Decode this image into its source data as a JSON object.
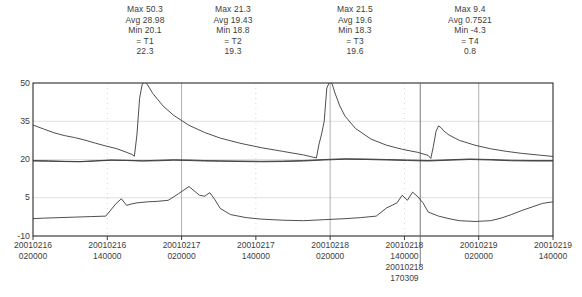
{
  "header": {
    "stats": [
      {
        "id": "T1",
        "max_label": "Max 50.3",
        "avg_label": "Avg 28.98",
        "min_label": "Min 20.1",
        "name_label": "= T1",
        "value_label": "22.3",
        "max": 50.3,
        "avg": 28.98,
        "min": 20.1,
        "cursor_value": 22.3
      },
      {
        "id": "T2",
        "max_label": "Max 21.3",
        "avg_label": "Avg 19.43",
        "min_label": "Min 18.8",
        "name_label": "= T2",
        "value_label": "19.3",
        "max": 21.3,
        "avg": 19.43,
        "min": 18.8,
        "cursor_value": 19.3
      },
      {
        "id": "T3",
        "max_label": "Max 21.5",
        "avg_label": "Avg 19.6",
        "min_label": "Min 18.3",
        "name_label": "= T3",
        "value_label": "19.6",
        "max": 21.5,
        "avg": 19.6,
        "min": 18.3,
        "cursor_value": 19.6
      },
      {
        "id": "T4",
        "max_label": "Max 9.4",
        "avg_label": "Avg 0.7521",
        "min_label": "Min -4.3",
        "name_label": "= T4",
        "value_label": "0.8",
        "max": 9.4,
        "avg": 0.7521,
        "min": -4.3,
        "cursor_value": 0.8
      }
    ]
  },
  "axes": {
    "y_ticks": [
      "50",
      "35",
      "20",
      "5",
      "-10"
    ],
    "x_ticks": [
      {
        "date": "20010216",
        "time": "020000"
      },
      {
        "date": "20010216",
        "time": "140000"
      },
      {
        "date": "20010217",
        "time": "020000"
      },
      {
        "date": "20010217",
        "time": "140000"
      },
      {
        "date": "20010218",
        "time": "020000"
      },
      {
        "date": "20010218",
        "time": "140000"
      },
      {
        "date": "20010219",
        "time": "020000"
      },
      {
        "date": "20010219",
        "time": "140000"
      }
    ]
  },
  "cursor": {
    "date": "20010218",
    "time": "170309"
  },
  "chart_data": {
    "type": "line",
    "title": "",
    "xlabel": "",
    "ylabel": "",
    "ylim": [
      -10,
      50
    ],
    "ytick_values": [
      50,
      35,
      20,
      5,
      -10
    ],
    "grid": {
      "horizontal": true,
      "vertical": true,
      "vertical_style": "dotted"
    },
    "legend": "none",
    "x_axis_type": "datetime",
    "x_start": "20010216 020000",
    "x_end": "20010219 140000",
    "x_tick_labels": [
      "20010216 020000",
      "20010216 140000",
      "20010217 020000",
      "20010217 140000",
      "20010218 020000",
      "20010218 140000",
      "20010219 020000",
      "20010219 140000"
    ],
    "cursor_x": "20010218 170309",
    "series": [
      {
        "name": "T1",
        "color": "#3a3a3a",
        "max": 50.3,
        "avg": 28.98,
        "min": 20.1,
        "value_at_cursor": 22.3,
        "x": [
          0,
          0.02,
          0.04,
          0.06,
          0.08,
          0.1,
          0.12,
          0.14,
          0.16,
          0.175,
          0.19,
          0.195,
          0.2,
          0.205,
          0.21,
          0.215,
          0.22,
          0.23,
          0.25,
          0.27,
          0.3,
          0.33,
          0.36,
          0.4,
          0.44,
          0.48,
          0.52,
          0.545,
          0.55,
          0.555,
          0.56,
          0.565,
          0.57,
          0.575,
          0.58,
          0.59,
          0.6,
          0.62,
          0.65,
          0.68,
          0.71,
          0.74,
          0.76,
          0.765,
          0.77,
          0.775,
          0.78,
          0.785,
          0.79,
          0.8,
          0.82,
          0.85,
          0.88,
          0.91,
          0.94,
          0.97,
          1.0
        ],
        "y": [
          33.5,
          32.0,
          30.5,
          29.4,
          28.6,
          27.6,
          26.4,
          25.3,
          24.3,
          23.2,
          22.0,
          21.3,
          30.0,
          44.0,
          49.5,
          50.3,
          49.4,
          46.0,
          41.0,
          37.4,
          33.4,
          30.6,
          28.4,
          26.3,
          24.6,
          23.2,
          21.8,
          20.6,
          26.0,
          30.0,
          35.0,
          48.0,
          50.3,
          49.8,
          46.5,
          41.0,
          37.0,
          32.2,
          28.0,
          25.6,
          24.0,
          22.8,
          21.6,
          20.4,
          25.2,
          31.0,
          33.2,
          32.4,
          31.2,
          29.6,
          27.5,
          25.6,
          24.2,
          23.2,
          22.4,
          21.8,
          21.2
        ]
      },
      {
        "name": "T2",
        "color": "#3a3a3a",
        "max": 21.3,
        "avg": 19.43,
        "min": 18.8,
        "value_at_cursor": 19.3,
        "x": [
          0,
          0.03,
          0.06,
          0.09,
          0.12,
          0.15,
          0.18,
          0.21,
          0.24,
          0.27,
          0.3,
          0.33,
          0.36,
          0.4,
          0.44,
          0.48,
          0.52,
          0.56,
          0.6,
          0.64,
          0.68,
          0.72,
          0.76,
          0.8,
          0.84,
          0.88,
          0.92,
          0.96,
          1.0
        ],
        "y": [
          19.6,
          19.5,
          19.3,
          19.2,
          19.5,
          19.8,
          19.7,
          19.5,
          19.7,
          19.9,
          19.8,
          19.6,
          19.5,
          19.4,
          19.3,
          19.4,
          19.6,
          20.0,
          20.3,
          20.2,
          20.0,
          19.8,
          19.6,
          19.9,
          20.2,
          20.0,
          19.7,
          19.6,
          19.6
        ]
      },
      {
        "name": "T3",
        "color": "#3a3a3a",
        "max": 21.5,
        "avg": 19.6,
        "min": 18.3,
        "value_at_cursor": 19.6,
        "x": [
          0,
          0.03,
          0.06,
          0.09,
          0.12,
          0.15,
          0.18,
          0.21,
          0.24,
          0.27,
          0.3,
          0.33,
          0.36,
          0.4,
          0.44,
          0.48,
          0.52,
          0.56,
          0.6,
          0.64,
          0.68,
          0.72,
          0.76,
          0.8,
          0.84,
          0.88,
          0.92,
          0.96,
          1.0
        ],
        "y": [
          19.4,
          19.3,
          19.2,
          19.1,
          19.4,
          19.7,
          19.6,
          19.4,
          19.5,
          19.7,
          19.6,
          19.4,
          19.3,
          19.2,
          19.1,
          19.2,
          19.4,
          19.8,
          20.1,
          20.0,
          19.8,
          19.6,
          19.4,
          19.7,
          20.0,
          19.8,
          19.5,
          19.4,
          19.4
        ]
      },
      {
        "name": "T4",
        "color": "#3a3a3a",
        "max": 9.4,
        "avg": 0.7521,
        "min": -4.3,
        "value_at_cursor": 0.8,
        "x": [
          0,
          0.02,
          0.05,
          0.08,
          0.11,
          0.14,
          0.16,
          0.17,
          0.18,
          0.19,
          0.2,
          0.22,
          0.24,
          0.26,
          0.28,
          0.3,
          0.32,
          0.33,
          0.34,
          0.35,
          0.36,
          0.38,
          0.41,
          0.44,
          0.48,
          0.52,
          0.56,
          0.6,
          0.63,
          0.66,
          0.68,
          0.7,
          0.71,
          0.72,
          0.73,
          0.74,
          0.75,
          0.76,
          0.78,
          0.8,
          0.82,
          0.85,
          0.88,
          0.9,
          0.92,
          0.94,
          0.96,
          0.98,
          1.0
        ],
        "y": [
          -3.2,
          -3.0,
          -2.8,
          -2.6,
          -2.4,
          -2.2,
          2.8,
          4.6,
          2.0,
          2.6,
          3.0,
          3.4,
          3.6,
          4.0,
          6.6,
          9.4,
          6.0,
          5.6,
          7.0,
          4.2,
          0.8,
          -1.6,
          -2.8,
          -3.4,
          -3.8,
          -4.0,
          -3.6,
          -3.2,
          -2.8,
          -2.2,
          1.0,
          3.0,
          6.0,
          4.0,
          7.2,
          5.4,
          3.0,
          -0.6,
          -2.2,
          -3.2,
          -4.0,
          -4.3,
          -4.0,
          -3.0,
          -1.6,
          0.0,
          1.4,
          2.8,
          3.4
        ]
      }
    ]
  },
  "plot_geometry": {
    "left": 33,
    "right": 553,
    "top": 83,
    "bottom": 236,
    "y_min": -10,
    "y_max": 50
  }
}
